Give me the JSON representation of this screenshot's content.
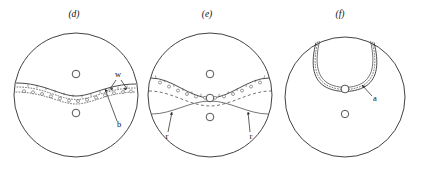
{
  "figure": {
    "width": 425,
    "height": 179,
    "background_color": "#ffffff",
    "ink_color": "#2b2b2b",
    "panels": [
      {
        "id": "panel-d",
        "label": "(d)",
        "label_x": 74,
        "label_y": 17,
        "disk": {
          "cx": 76,
          "cy": 95,
          "r": 62
        },
        "center_marker": {
          "cx": 76,
          "cy": 98,
          "r": 3.6
        },
        "vertices": [
          {
            "name": "upper-vertex",
            "cx": 76,
            "cy": 74,
            "r": 3.8
          },
          {
            "name": "lower-vertex",
            "cx": 76,
            "cy": 113,
            "r": 3.8
          }
        ],
        "annotations": [
          {
            "id": "w",
            "text": "w",
            "text_x": 118,
            "text_y": 77,
            "arrows": [
              {
                "x1": 119,
                "y1": 80,
                "x2": 112,
                "y2": 90
              },
              {
                "x1": 122,
                "y1": 80,
                "x2": 128,
                "y2": 90
              }
            ]
          },
          {
            "id": "b",
            "text": "b",
            "text_x": 119,
            "text_y": 126,
            "arrows": [
              {
                "x1": 117,
                "y1": 122,
                "x2": 106,
                "y2": 89
              }
            ]
          }
        ]
      },
      {
        "id": "panel-e",
        "label": "(e)",
        "label_x": 207,
        "label_y": 17,
        "disk": {
          "cx": 210,
          "cy": 95,
          "r": 62
        },
        "center_marker": {
          "cx": 210,
          "cy": 98,
          "r": 3.6
        },
        "vertices": [
          {
            "name": "upper-vertex",
            "cx": 210,
            "cy": 74,
            "r": 3.8
          },
          {
            "name": "lower-vertex",
            "cx": 210,
            "cy": 98,
            "r": 3.8
          }
        ],
        "annotations": [
          {
            "id": "r-left",
            "text": "r",
            "text_x": 166,
            "text_y": 137,
            "arrows": [
              {
                "x1": 168,
                "y1": 131,
                "x2": 172,
                "y2": 110
              }
            ]
          },
          {
            "id": "r-right",
            "text": "r",
            "text_x": 250,
            "text_y": 137,
            "arrows": [
              {
                "x1": 250,
                "y1": 131,
                "x2": 248,
                "y2": 110
              }
            ]
          }
        ]
      },
      {
        "id": "panel-f",
        "label": "(f)",
        "label_x": 340,
        "label_y": 17,
        "disk": {
          "cx": 345,
          "cy": 97,
          "r": 60
        },
        "center_marker": {
          "cx": 345,
          "cy": 114,
          "r": 3.6
        },
        "vertices": [
          {
            "name": "loop-bottom-vertex",
            "cx": 345,
            "cy": 89,
            "r": 3.8
          }
        ],
        "annotations": [
          {
            "id": "a",
            "text": "a",
            "text_x": 374,
            "text_y": 99,
            "arrows": [
              {
                "x1": 372,
                "y1": 95,
                "x2": 362,
                "y2": 85
              }
            ]
          }
        ]
      }
    ],
    "legend_notes": {
      "solid_curve": "geodesic boundary",
      "dotted_curve": "band edge",
      "dashed_curve": "auxiliary curve",
      "bead_circle": "decoration marker"
    }
  }
}
